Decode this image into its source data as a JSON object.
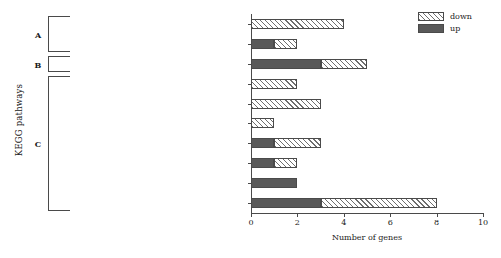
{
  "chart_data": {
    "type": "bar",
    "orientation": "horizontal",
    "stacked": true,
    "title": "",
    "xlabel": "Number of genes",
    "ylabel": "KEGG pathways",
    "xlim": [
      0,
      10
    ],
    "xticks": [
      0,
      2,
      4,
      6,
      8,
      10
    ],
    "grid": false,
    "legend_position": "top-right",
    "categories": [
      "Folding, sorting and degradation",
      "Translation",
      "Environmental adaptation",
      "Energy metabolism",
      "Lipid metabolism",
      "Metabolism of terpenoids and polyketides",
      "Biosynthesis of other secondary metabolites",
      "Metabolism of cofactors and vitamins",
      "Amino acid metabolism",
      "Carbohydrate metabolism"
    ],
    "series": [
      {
        "name": "up",
        "values": [
          0,
          1,
          3,
          0,
          0,
          0,
          1,
          1,
          2,
          3
        ]
      },
      {
        "name": "down",
        "values": [
          4,
          1,
          2,
          2,
          3,
          1,
          2,
          1,
          0,
          5
        ]
      }
    ],
    "totals": [
      4,
      2,
      5,
      2,
      3,
      1,
      3,
      2,
      2,
      8
    ]
  },
  "legend": {
    "entries": [
      {
        "label": "down",
        "style": "hatched"
      },
      {
        "label": "up",
        "style": "solid-gray"
      }
    ]
  },
  "groups": [
    {
      "letter": "A",
      "categories": [
        "Folding, sorting and degradation",
        "Translation"
      ]
    },
    {
      "letter": "B",
      "categories": [
        "Environmental adaptation"
      ]
    },
    {
      "letter": "C",
      "categories": [
        "Energy metabolism",
        "Lipid metabolism",
        "Metabolism of terpenoids and polyketides",
        "Biosynthesis of other secondary metabolites",
        "Metabolism of cofactors and vitamins",
        "Amino acid metabolism",
        "Carbohydrate metabolism"
      ]
    }
  ],
  "colors": {
    "up": "#595959",
    "down_hatch": "#6e6e6e",
    "axis": "#4a4a4a",
    "background": "#ffffff"
  }
}
